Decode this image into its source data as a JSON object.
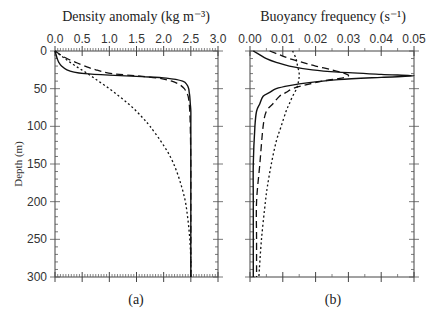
{
  "chart_data": [
    {
      "type": "line",
      "panel_label": "(a)",
      "title": "Density anomaly (kg m⁻³)",
      "xlabel": "Density anomaly (kg m⁻³)",
      "ylabel": "Depth (m)",
      "xlim": [
        0,
        3.0
      ],
      "ylim": [
        300,
        0
      ],
      "xticks": [
        "0.0",
        "0.5",
        "1.0",
        "1.5",
        "2.0",
        "2.5",
        "3.0"
      ],
      "yticks": [
        "0",
        "50",
        "100",
        "150",
        "200",
        "250",
        "300"
      ],
      "grid": false,
      "series": [
        {
          "name": "solid",
          "style": "solid",
          "depth": [
            0,
            5,
            10,
            15,
            20,
            25,
            28,
            30,
            32,
            34,
            36,
            40,
            45,
            50,
            55,
            60,
            70,
            80,
            100,
            150,
            200,
            250,
            300
          ],
          "values": [
            0.0,
            0.02,
            0.04,
            0.07,
            0.12,
            0.22,
            0.35,
            0.55,
            1.0,
            1.6,
            2.05,
            2.35,
            2.43,
            2.46,
            2.47,
            2.48,
            2.49,
            2.5,
            2.5,
            2.5,
            2.5,
            2.5,
            2.5
          ]
        },
        {
          "name": "dashed",
          "style": "dashed",
          "depth": [
            0,
            5,
            10,
            15,
            20,
            25,
            30,
            33,
            36,
            40,
            45,
            50,
            55,
            60,
            70,
            80,
            100,
            150,
            200,
            250,
            300
          ],
          "values": [
            0.0,
            0.1,
            0.22,
            0.38,
            0.55,
            0.75,
            1.05,
            1.5,
            1.9,
            2.15,
            2.3,
            2.38,
            2.42,
            2.45,
            2.47,
            2.48,
            2.49,
            2.5,
            2.5,
            2.5,
            2.5
          ]
        },
        {
          "name": "dotted",
          "style": "dotted",
          "depth": [
            0,
            10,
            20,
            30,
            40,
            50,
            60,
            70,
            80,
            90,
            100,
            120,
            140,
            160,
            180,
            200,
            220,
            240,
            260,
            280,
            300
          ],
          "values": [
            0.0,
            0.18,
            0.38,
            0.6,
            0.8,
            1.0,
            1.18,
            1.35,
            1.5,
            1.63,
            1.75,
            1.95,
            2.12,
            2.24,
            2.33,
            2.4,
            2.44,
            2.47,
            2.49,
            2.5,
            2.5
          ]
        }
      ]
    },
    {
      "type": "line",
      "panel_label": "(b)",
      "title": "Buoyancy frequency (s⁻¹)",
      "xlabel": "Buoyancy frequency (s⁻¹)",
      "ylabel": "",
      "xlim": [
        0,
        0.05
      ],
      "ylim": [
        300,
        0
      ],
      "xticks": [
        "0.00",
        "0.01",
        "0.02",
        "0.03",
        "0.04",
        "0.05"
      ],
      "yticks": [],
      "grid": false,
      "series": [
        {
          "name": "solid",
          "style": "solid",
          "depth": [
            0,
            5,
            10,
            15,
            20,
            25,
            28,
            31,
            33,
            35,
            38,
            42,
            46,
            50,
            55,
            60,
            70,
            80,
            100,
            150,
            200,
            250,
            300
          ],
          "values": [
            0.001,
            0.003,
            0.005,
            0.008,
            0.012,
            0.019,
            0.027,
            0.04,
            0.05,
            0.04,
            0.027,
            0.018,
            0.012,
            0.008,
            0.006,
            0.004,
            0.003,
            0.002,
            0.0015,
            0.001,
            0.001,
            0.001,
            0.001
          ]
        },
        {
          "name": "dashed",
          "style": "dashed",
          "depth": [
            0,
            5,
            10,
            15,
            20,
            25,
            30,
            33,
            36,
            40,
            45,
            50,
            55,
            60,
            70,
            80,
            100,
            150,
            200,
            250,
            300
          ],
          "values": [
            0.006,
            0.009,
            0.012,
            0.016,
            0.02,
            0.025,
            0.029,
            0.03,
            0.028,
            0.022,
            0.017,
            0.013,
            0.011,
            0.009,
            0.007,
            0.005,
            0.004,
            0.003,
            0.002,
            0.002,
            0.002
          ]
        },
        {
          "name": "dotted",
          "style": "dotted",
          "depth": [
            0,
            10,
            20,
            30,
            40,
            50,
            60,
            70,
            80,
            100,
            120,
            150,
            180,
            200,
            250,
            300
          ],
          "values": [
            0.013,
            0.014,
            0.0145,
            0.015,
            0.0148,
            0.0142,
            0.013,
            0.012,
            0.011,
            0.0095,
            0.008,
            0.0065,
            0.0053,
            0.0047,
            0.0035,
            0.0027
          ]
        }
      ]
    }
  ],
  "captions": {
    "a": "(a)",
    "b": "(b)"
  },
  "colors": {
    "line": "#111111",
    "axis": "#444444"
  }
}
